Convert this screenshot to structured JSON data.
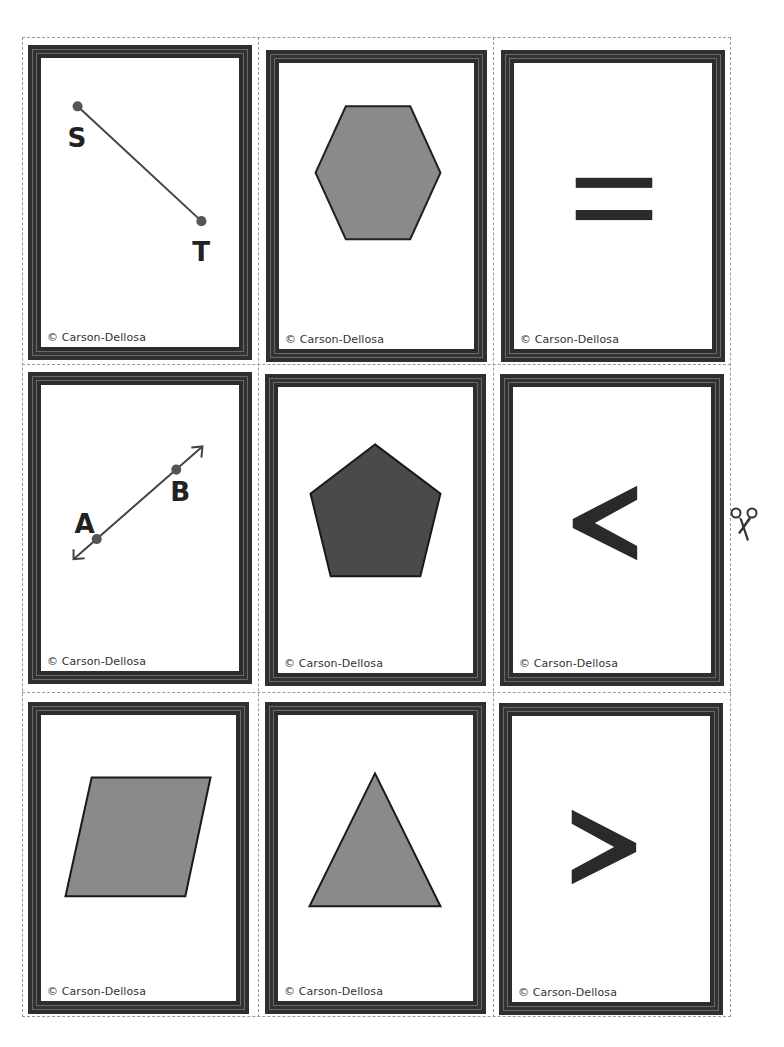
{
  "sheet": {
    "cut_guide": "dashed",
    "scissors_icon": "scissors-icon"
  },
  "colors": {
    "frame": "#2f2f2f",
    "shape_fill_light": "#8a8a8a",
    "shape_fill_dark": "#4a4a4a",
    "ink": "#222222"
  },
  "cards": [
    {
      "id": "segment-st",
      "type": "line-segment",
      "labels": [
        "S",
        "T"
      ],
      "copyright": "© Carson-Dellosa"
    },
    {
      "id": "hexagon",
      "type": "hexagon",
      "copyright": "© Carson-Dellosa"
    },
    {
      "id": "equals",
      "type": "symbol",
      "symbol": "=",
      "copyright": "© Carson-Dellosa"
    },
    {
      "id": "line-ab",
      "type": "line",
      "labels": [
        "A",
        "B"
      ],
      "copyright": "© Carson-Dellosa"
    },
    {
      "id": "pentagon",
      "type": "pentagon",
      "copyright": "© Carson-Dellosa"
    },
    {
      "id": "less-than",
      "type": "symbol",
      "symbol": "<",
      "copyright": "© Carson-Dellosa"
    },
    {
      "id": "parallelogram",
      "type": "parallelogram",
      "copyright": "© Carson-Dellosa"
    },
    {
      "id": "triangle",
      "type": "triangle",
      "copyright": "© Carson-Dellosa"
    },
    {
      "id": "greater-than",
      "type": "symbol",
      "symbol": ">",
      "copyright": "© Carson-Dellosa"
    }
  ]
}
